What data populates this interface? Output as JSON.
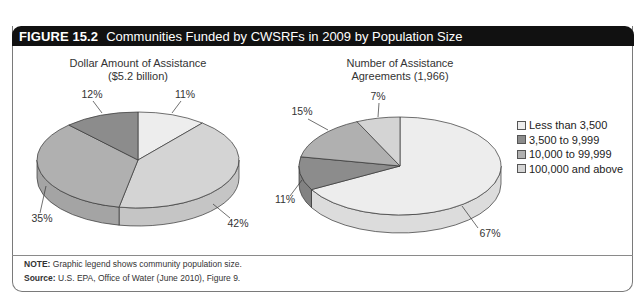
{
  "figure": {
    "number": "FIGURE 15.2",
    "title": "Communities Funded by CWSRFs in 2009 by Population Size"
  },
  "legend": [
    {
      "label": "Less than 3,500",
      "color": "#ededed"
    },
    {
      "label": "3,500 to 9,999",
      "color": "#8c8c8c"
    },
    {
      "label": "10,000 to 99,999",
      "color": "#b0b0b0"
    },
    {
      "label": "100,000 and above",
      "color": "#d4d4d4"
    }
  ],
  "notes": {
    "note_label": "NOTE:",
    "note_text": " Graphic legend shows community population size.",
    "source_label": "Source:",
    "source_text": " U.S. EPA, Office of Water (June 2010), Figure 9."
  },
  "chart_data": [
    {
      "type": "pie",
      "title": "Dollar Amount of Assistance",
      "subtitle": "($5.2 billion)",
      "categories": [
        "Less than 3,500",
        "3,500 to 9,999",
        "10,000 to 99,999",
        "100,000 and above"
      ],
      "values": [
        11,
        12,
        35,
        42
      ],
      "labels": [
        "11%",
        "12%",
        "35%",
        "42%"
      ],
      "legend_position": "right",
      "style": "3d"
    },
    {
      "type": "pie",
      "title": "Number of Assistance",
      "subtitle": "Agreements (1,966)",
      "categories": [
        "Less than 3,500",
        "3,500 to 9,999",
        "10,000 to 99,999",
        "100,000 and above"
      ],
      "values": [
        67,
        11,
        15,
        7
      ],
      "labels": [
        "67%",
        "11%",
        "15%",
        "7%"
      ],
      "legend_position": "right",
      "style": "3d"
    }
  ]
}
